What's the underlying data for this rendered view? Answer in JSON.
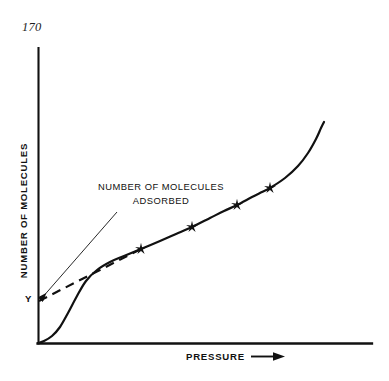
{
  "page": {
    "folio": "170",
    "background_color": "#ffffff",
    "ink_color": "#111111"
  },
  "figure": {
    "y_axis_label": "NUMBER OF MOLECULES",
    "x_axis_label": "PRESSURE",
    "x_axis_arrow_icon": "right-arrow-icon",
    "annotation_line_1": "NUMBER OF MOLECULES",
    "annotation_line_2": "ADSORBED",
    "y_intercept_label": "Y",
    "marker_icon": "star-marker-icon",
    "leader_arrow_icon": "leader-arrow-icon"
  },
  "chart_data": {
    "type": "line",
    "title": "",
    "xlabel": "PRESSURE",
    "ylabel": "NUMBER OF MOLECULES",
    "grid": false,
    "legend": false,
    "axes": {
      "x_origin_px": 38,
      "y_origin_px": 343,
      "x_end_px": 372,
      "y_top_px": 48,
      "ticks": [],
      "tick_labels": []
    },
    "series": [
      {
        "name": "adsorption isotherm",
        "style": "solid",
        "linewidth": 2.1,
        "points_px": [
          [
            38,
            343
          ],
          [
            44,
            341
          ],
          [
            52,
            336
          ],
          [
            60,
            327
          ],
          [
            68,
            313
          ],
          [
            77,
            296
          ],
          [
            86,
            281
          ],
          [
            97,
            270
          ],
          [
            110,
            262
          ],
          [
            124,
            256
          ],
          [
            141,
            249
          ],
          [
            160,
            241
          ],
          [
            176,
            234
          ],
          [
            192,
            227
          ],
          [
            210,
            218
          ],
          [
            224,
            211
          ],
          [
            237,
            205
          ],
          [
            252,
            197
          ],
          [
            262,
            192
          ],
          [
            270,
            188
          ],
          [
            285,
            178
          ],
          [
            298,
            166
          ],
          [
            308,
            153
          ],
          [
            316,
            139
          ],
          [
            321,
            128
          ],
          [
            324,
            122
          ]
        ]
      },
      {
        "name": "extrapolated monolayer line",
        "style": "dashed",
        "linewidth": 2.1,
        "points_px": [
          [
            39,
            301
          ],
          [
            141,
            249
          ]
        ]
      }
    ],
    "markers": {
      "symbol": "star",
      "points_px": [
        [
          141,
          249
        ],
        [
          192,
          227
        ],
        [
          237,
          205
        ],
        [
          270,
          188
        ]
      ]
    },
    "annotations": [
      {
        "text": "NUMBER OF MOLECULES ADSORBED",
        "text_px": [
          161,
          193
        ],
        "leader_from_px": [
          117,
          212
        ],
        "leader_to_px": [
          41,
          299
        ],
        "arrowhead": true
      },
      {
        "text": "Y",
        "text_px": [
          30,
          300
        ],
        "describes": "y-axis intercept of extrapolated line"
      }
    ]
  }
}
